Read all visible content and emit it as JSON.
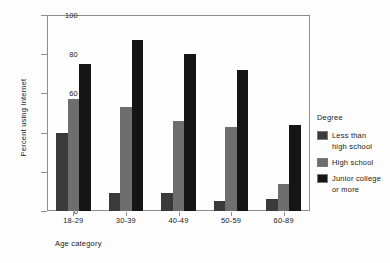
{
  "chart_data": {
    "type": "bar",
    "title": "",
    "xlabel": "Age category",
    "ylabel": "Percent using Internet",
    "categories": [
      "18-29",
      "30-39",
      "40-49",
      "50-59",
      "60-89"
    ],
    "ylim": [
      0,
      100
    ],
    "yticks": [
      0,
      20,
      40,
      60,
      80,
      100
    ],
    "grid": false,
    "legend_position": "right",
    "legend_title": "Degree",
    "series": [
      {
        "name": "Less than\nhigh school",
        "color": "#3a3a3a",
        "values": [
          40,
          9,
          9,
          5,
          6
        ]
      },
      {
        "name": "High school",
        "color": "#6e6e6e",
        "values": [
          57,
          53,
          46,
          43,
          14
        ]
      },
      {
        "name": "Junior college\nor more",
        "color": "#151515",
        "values": [
          75,
          87,
          80,
          72,
          44
        ]
      }
    ]
  }
}
